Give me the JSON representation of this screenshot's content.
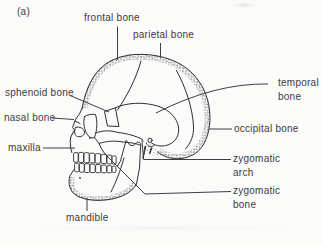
{
  "figure_label": "(a)",
  "colors": {
    "ink": "#2f2f2f",
    "text": "#3c3c3c",
    "background": "#fbfbfa"
  },
  "diagram": {
    "type": "line-art anatomical diagram",
    "labels": [
      {
        "id": "frontal-bone",
        "text": "frontal bone"
      },
      {
        "id": "parietal-bone",
        "text": "parietal bone"
      },
      {
        "id": "temporal-bone",
        "text": "temporal bone"
      },
      {
        "id": "sphenoid-bone",
        "text": "sphenoid bone"
      },
      {
        "id": "nasal-bone",
        "text": "nasal bone"
      },
      {
        "id": "occipital-bone",
        "text": "occipital bone"
      },
      {
        "id": "maxilla",
        "text": "maxilla"
      },
      {
        "id": "zygomatic-arch",
        "text": "zygomatic arch"
      },
      {
        "id": "zygomatic-bone",
        "text": "zygomatic bone"
      },
      {
        "id": "mandible",
        "text": "mandible"
      }
    ]
  }
}
